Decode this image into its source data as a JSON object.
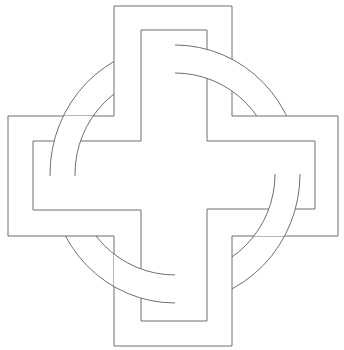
{
  "figure": {
    "stroke_color": "#6e6e6e",
    "background_color": "#ffffff"
  },
  "cross": {
    "outer_polygon": "114,6 232,6 232,116 338,116 338,236 232,236 232,346 114,346 114,236 8,236 8,116 114,116",
    "inner_polygon": "141,30 207,30 207,141 315,141 315,209 207,209 207,321 141,321 141,210 33,210 33,141 141,141"
  },
  "ring": {
    "cx": 175,
    "cy": 174,
    "outer_rx": 125,
    "outer_ry": 129,
    "inner_rx": 100,
    "inner_ry": 101
  }
}
